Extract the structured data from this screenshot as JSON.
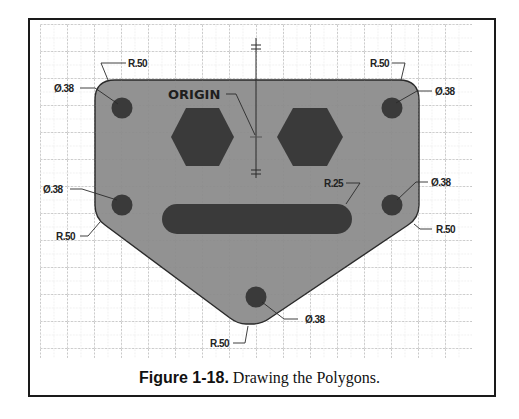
{
  "figure": {
    "caption_label": "Figure 1-18.",
    "caption_text": " Drawing the Polygons."
  },
  "drawing": {
    "origin_label": "ORIGIN",
    "dimensions": {
      "radius_top_left": "R.50",
      "radius_top_right": "R.50",
      "radius_mid_left": "R.50",
      "radius_mid_right": "R.50",
      "radius_bottom": "R.50",
      "radius_slot": "R.25",
      "dia_top_left": "Ø.38",
      "dia_top_right": "Ø.38",
      "dia_mid_left": "Ø.38",
      "dia_mid_right": "Ø.38",
      "dia_bottom": "Ø.38"
    },
    "colors": {
      "plate_fill": "#8c8c8c",
      "cutout_fill": "#3a3a3a",
      "outline": "#2a2a2a",
      "grid": "#9a9a9a"
    }
  }
}
